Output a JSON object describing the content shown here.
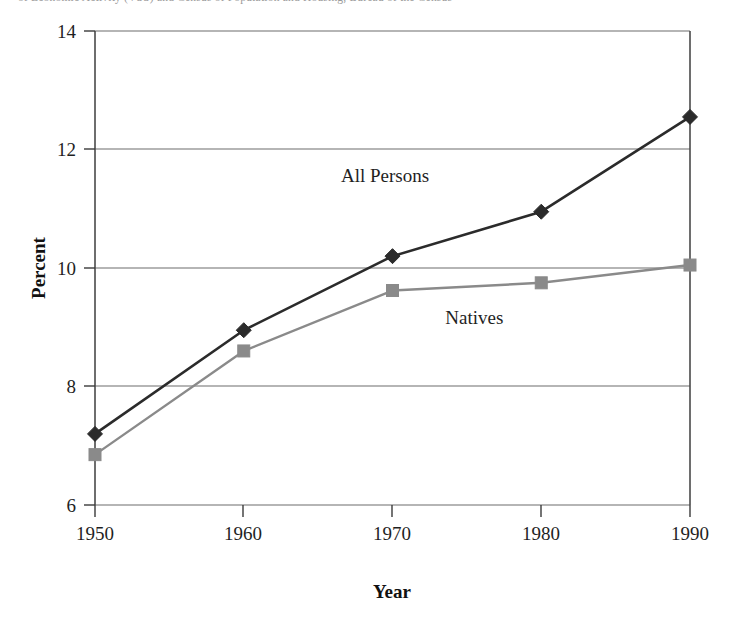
{
  "clipped_header": {
    "text": "of Economic Activity (VSS) and Census of Population and Housing, Bureau of the Census"
  },
  "chart_data": {
    "type": "line",
    "title": "",
    "subtitle": "",
    "xlabel": "Year",
    "ylabel": "Percent",
    "categories": [
      1950,
      1960,
      1970,
      1980,
      1990
    ],
    "x_tick_labels": [
      "1950",
      "1960",
      "1970",
      "1980",
      "1990"
    ],
    "y_tick_labels": [
      "6",
      "8",
      "10",
      "12",
      "14"
    ],
    "y_ticks": [
      6,
      8,
      10,
      12,
      14
    ],
    "xlim": [
      1950,
      1990
    ],
    "ylim": [
      6,
      14
    ],
    "grid": "horizontal",
    "legend_position": "inline-annotations",
    "series": [
      {
        "name": "All Persons",
        "color": "#2b2b2b",
        "marker": "diamond",
        "values": [
          7.2,
          8.95,
          10.2,
          10.95,
          12.55
        ],
        "annotation": {
          "label": "All Persons",
          "x": 1969.5,
          "y": 11.45
        }
      },
      {
        "name": "Natives",
        "color": "#8a8a8a",
        "marker": "square",
        "values": [
          6.85,
          8.6,
          9.62,
          9.75,
          10.05
        ],
        "annotation": {
          "label": "Natives",
          "x": 1975.5,
          "y": 9.05
        }
      }
    ]
  },
  "axes": {
    "frame_color": "#4a4a4a",
    "grid_color": "#9d9d9d"
  }
}
